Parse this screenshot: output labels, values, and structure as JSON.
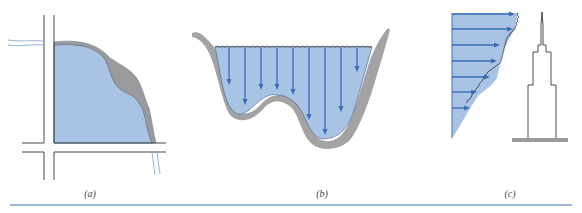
{
  "figure": {
    "panels": [
      {
        "id": "a",
        "label": "(a)",
        "description": "Plan view of flooded corner between roads with water region and gray sediment band"
      },
      {
        "id": "b",
        "label": "(b)",
        "description": "River cross-section with vertical downward arrows from water surface to bed"
      },
      {
        "id": "c",
        "label": "(c)",
        "description": "Wind velocity profile with horizontal arrows beside a tall tower building"
      }
    ]
  },
  "colors": {
    "water_fill": "#a9c3e4",
    "arrow": "#3a6db5",
    "bank_gray": "#9a9a9a",
    "line_dark": "#333333",
    "rule": "#9fb7d6"
  },
  "panel_b_arrows": {
    "x": [
      229,
      245,
      261,
      277,
      293,
      309,
      325,
      341,
      357
    ],
    "end_y": [
      85,
      105,
      90,
      90,
      95,
      120,
      135,
      112,
      72
    ]
  },
  "panel_c_arrows": {
    "y": [
      14,
      29,
      45,
      61,
      77,
      92,
      108
    ],
    "end_x": [
      515,
      513,
      500,
      497,
      490,
      477,
      470
    ]
  }
}
